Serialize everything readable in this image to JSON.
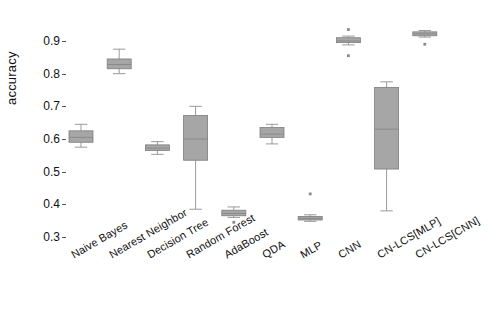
{
  "chart_data": {
    "type": "box",
    "title": "",
    "xlabel": "",
    "ylabel": "accuracy",
    "ylim": [
      0.285,
      0.945
    ],
    "yticks": [
      0.3,
      0.4,
      0.5,
      0.6,
      0.7,
      0.8,
      0.9
    ],
    "ytick_labels": [
      "0.3",
      "0.4",
      "0.5",
      "0.6",
      "0.7",
      "0.8",
      "0.9"
    ],
    "grid": false,
    "legend": "none",
    "box_fill_color": "#a6a6a6",
    "box_edge_color": "#7d7d7d",
    "median_color": "#8a8a8a",
    "whisker_color": "#9a9a9a",
    "outlier_color": "#8a8a8a",
    "categories": [
      "Naive Bayes",
      "Nearest Neighbor",
      "Decision Tree",
      "Random Forest",
      "AdaBoost",
      "QDA",
      "MLP",
      "CNN",
      "CN-LCS[MLP]",
      "CN-LCS[CNN]"
    ],
    "boxes": [
      {
        "label": "Naive Bayes",
        "whisker_low": 0.575,
        "q1": 0.59,
        "median": 0.605,
        "q3": 0.625,
        "whisker_high": 0.645,
        "outliers": []
      },
      {
        "label": "Nearest Neighbor",
        "whisker_low": 0.8,
        "q1": 0.815,
        "median": 0.828,
        "q3": 0.845,
        "whisker_high": 0.875,
        "outliers": []
      },
      {
        "label": "Decision Tree",
        "whisker_low": 0.553,
        "q1": 0.565,
        "median": 0.572,
        "q3": 0.582,
        "whisker_high": 0.592,
        "outliers": []
      },
      {
        "label": "Random Forest",
        "whisker_low": 0.385,
        "q1": 0.535,
        "median": 0.6,
        "q3": 0.672,
        "whisker_high": 0.7,
        "outliers": []
      },
      {
        "label": "AdaBoost",
        "whisker_low": 0.36,
        "q1": 0.365,
        "median": 0.372,
        "q3": 0.382,
        "whisker_high": 0.392,
        "outliers": [
          0.345
        ]
      },
      {
        "label": "QDA",
        "whisker_low": 0.585,
        "q1": 0.605,
        "median": 0.615,
        "q3": 0.635,
        "whisker_high": 0.645,
        "outliers": []
      },
      {
        "label": "MLP",
        "whisker_low": 0.348,
        "q1": 0.352,
        "median": 0.357,
        "q3": 0.363,
        "whisker_high": 0.368,
        "outliers": [
          0.432
        ]
      },
      {
        "label": "CNN",
        "whisker_low": 0.888,
        "q1": 0.895,
        "median": 0.9,
        "q3": 0.91,
        "whisker_high": 0.915,
        "outliers": [
          0.935,
          0.855
        ]
      },
      {
        "label": "CN-LCS[MLP]",
        "whisker_low": 0.38,
        "q1": 0.508,
        "median": 0.63,
        "q3": 0.758,
        "whisker_high": 0.775,
        "outliers": []
      },
      {
        "label": "CN-LCS[CNN]",
        "whisker_low": 0.912,
        "q1": 0.916,
        "median": 0.922,
        "q3": 0.928,
        "whisker_high": 0.932,
        "outliers": [
          0.89
        ]
      }
    ]
  }
}
